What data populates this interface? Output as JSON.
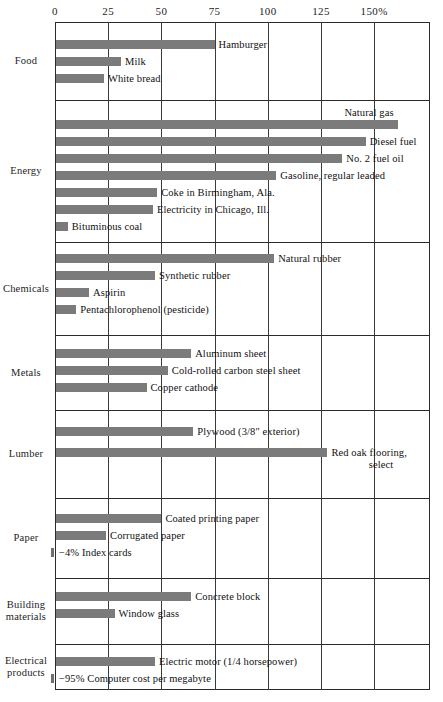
{
  "chart_data": {
    "type": "bar",
    "orientation": "horizontal",
    "title": "",
    "xlabel": "",
    "ylabel": "",
    "xlim": [
      0,
      176
    ],
    "xticks": [
      0,
      25,
      50,
      75,
      100,
      125,
      150
    ],
    "xtick_labels": [
      "0",
      "25",
      "50",
      "75",
      "100",
      "125",
      "150%"
    ],
    "grid": "vertical gridlines at each tick",
    "legend": "none",
    "value_unit": "percent",
    "groups": [
      {
        "category": "Food",
        "items": [
          {
            "label": "Hamburger",
            "value": 75
          },
          {
            "label": "Milk",
            "value": 31
          },
          {
            "label": "White bread",
            "value": 23
          }
        ]
      },
      {
        "category": "Energy",
        "items": [
          {
            "label": "Natural gas",
            "value": 161,
            "label_position": "above"
          },
          {
            "label": "Diesel fuel",
            "value": 146
          },
          {
            "label": "No. 2 fuel oil",
            "value": 135
          },
          {
            "label": "Gasoline, regular leaded",
            "value": 104
          },
          {
            "label": "Coke in Birmingham, Ala.",
            "value": 48
          },
          {
            "label": "Electricity in Chicago, Ill.",
            "value": 46
          },
          {
            "label": "Bituminous coal",
            "value": 6
          }
        ]
      },
      {
        "category": "Chemicals",
        "items": [
          {
            "label": "Natural rubber",
            "value": 103
          },
          {
            "label": "Synthetic rubber",
            "value": 47
          },
          {
            "label": "Aspirin",
            "value": 16
          },
          {
            "label": "Pentachlorophenol (pesticide)",
            "value": 10
          }
        ]
      },
      {
        "category": "Metals",
        "items": [
          {
            "label": "Aluminum sheet",
            "value": 64
          },
          {
            "label": "Cold-rolled carbon steel sheet",
            "value": 53
          },
          {
            "label": "Copper cathode",
            "value": 43
          }
        ]
      },
      {
        "category": "Lumber",
        "items": [
          {
            "label": "Plywood (3/8″ exterior)",
            "value": 65
          },
          {
            "label": "Red oak flooring,",
            "label_line2": "select",
            "value": 128
          }
        ]
      },
      {
        "category": "Paper",
        "items": [
          {
            "label": "Coated printing paper",
            "value": 50
          },
          {
            "label": "Corrugated paper",
            "value": 24
          },
          {
            "label": "Index cards",
            "value": -4,
            "value_label": "−4%"
          }
        ]
      },
      {
        "category": "Building materials",
        "category_line1": "Building",
        "category_line2": "materials",
        "items": [
          {
            "label": "Concrete block",
            "value": 64
          },
          {
            "label": "Window glass",
            "value": 28
          }
        ]
      },
      {
        "category": "Electrical products",
        "category_line1": "Electrical",
        "category_line2": "products",
        "items": [
          {
            "label": "Electric motor (1/4 horsepower)",
            "value": 47
          },
          {
            "label": "Computer cost per megabyte",
            "value": -95,
            "value_label": "−95%"
          }
        ]
      }
    ]
  },
  "axis": {
    "ticks": [
      {
        "label": "0",
        "x": 0
      },
      {
        "label": "25",
        "x": 25
      },
      {
        "label": "50",
        "x": 50
      },
      {
        "label": "75",
        "x": 75
      },
      {
        "label": "100",
        "x": 100
      },
      {
        "label": "125",
        "x": 125
      },
      {
        "label": "150%",
        "x": 150
      }
    ]
  },
  "colors": {
    "bar": "#7b7b7b",
    "gridline": "#3a3a3a",
    "frame": "#2b2b2b",
    "text": "#1a1a1a",
    "background": "#ffffff"
  }
}
